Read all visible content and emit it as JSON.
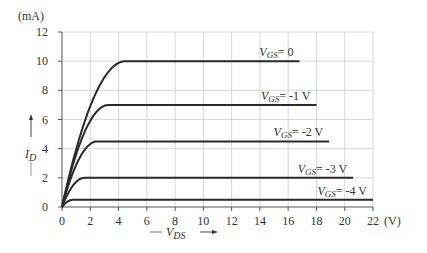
{
  "chart_data": {
    "type": "line",
    "xlabel": "V_DS",
    "x_unit": "(V)",
    "ylabel": "I_D",
    "y_unit": "(mA)",
    "xlim": [
      0,
      22
    ],
    "ylim": [
      0,
      12
    ],
    "x_ticks": [
      0,
      2,
      4,
      6,
      8,
      10,
      12,
      14,
      16,
      18,
      20,
      22
    ],
    "y_ticks": [
      0,
      2,
      4,
      6,
      8,
      10,
      12
    ],
    "grid": true,
    "legend": "inline labels above curves",
    "series": [
      {
        "name": "VGS = 0",
        "label_main": "V",
        "label_sub": "GS",
        "label_rest": "= 0",
        "saturation_current": 10,
        "knee_vds": 4.5,
        "end_vds": 16.8
      },
      {
        "name": "VGS = -1 V",
        "label_main": "V",
        "label_sub": "GS",
        "label_rest": "= -1 V",
        "saturation_current": 7,
        "knee_vds": 3.3,
        "end_vds": 18.0
      },
      {
        "name": "VGS = -2 V",
        "label_main": "V",
        "label_sub": "GS",
        "label_rest": "= -2 V",
        "saturation_current": 4.5,
        "knee_vds": 2.5,
        "end_vds": 18.9
      },
      {
        "name": "VGS = -3 V",
        "label_main": "V",
        "label_sub": "GS",
        "label_rest": "= -3 V",
        "saturation_current": 2,
        "knee_vds": 1.6,
        "end_vds": 20.6
      },
      {
        "name": "VGS = -4 V",
        "label_main": "V",
        "label_sub": "GS",
        "label_rest": "= -4  V",
        "saturation_current": 0.5,
        "knee_vds": 0.8,
        "end_vds": 22.0
      }
    ]
  },
  "axes": {
    "y_unit_label": "(mA)",
    "x_unit_label": "(V)",
    "y_title_main": "I",
    "y_title_sub": "D",
    "x_title_main": "V",
    "x_title_sub": "DS"
  }
}
